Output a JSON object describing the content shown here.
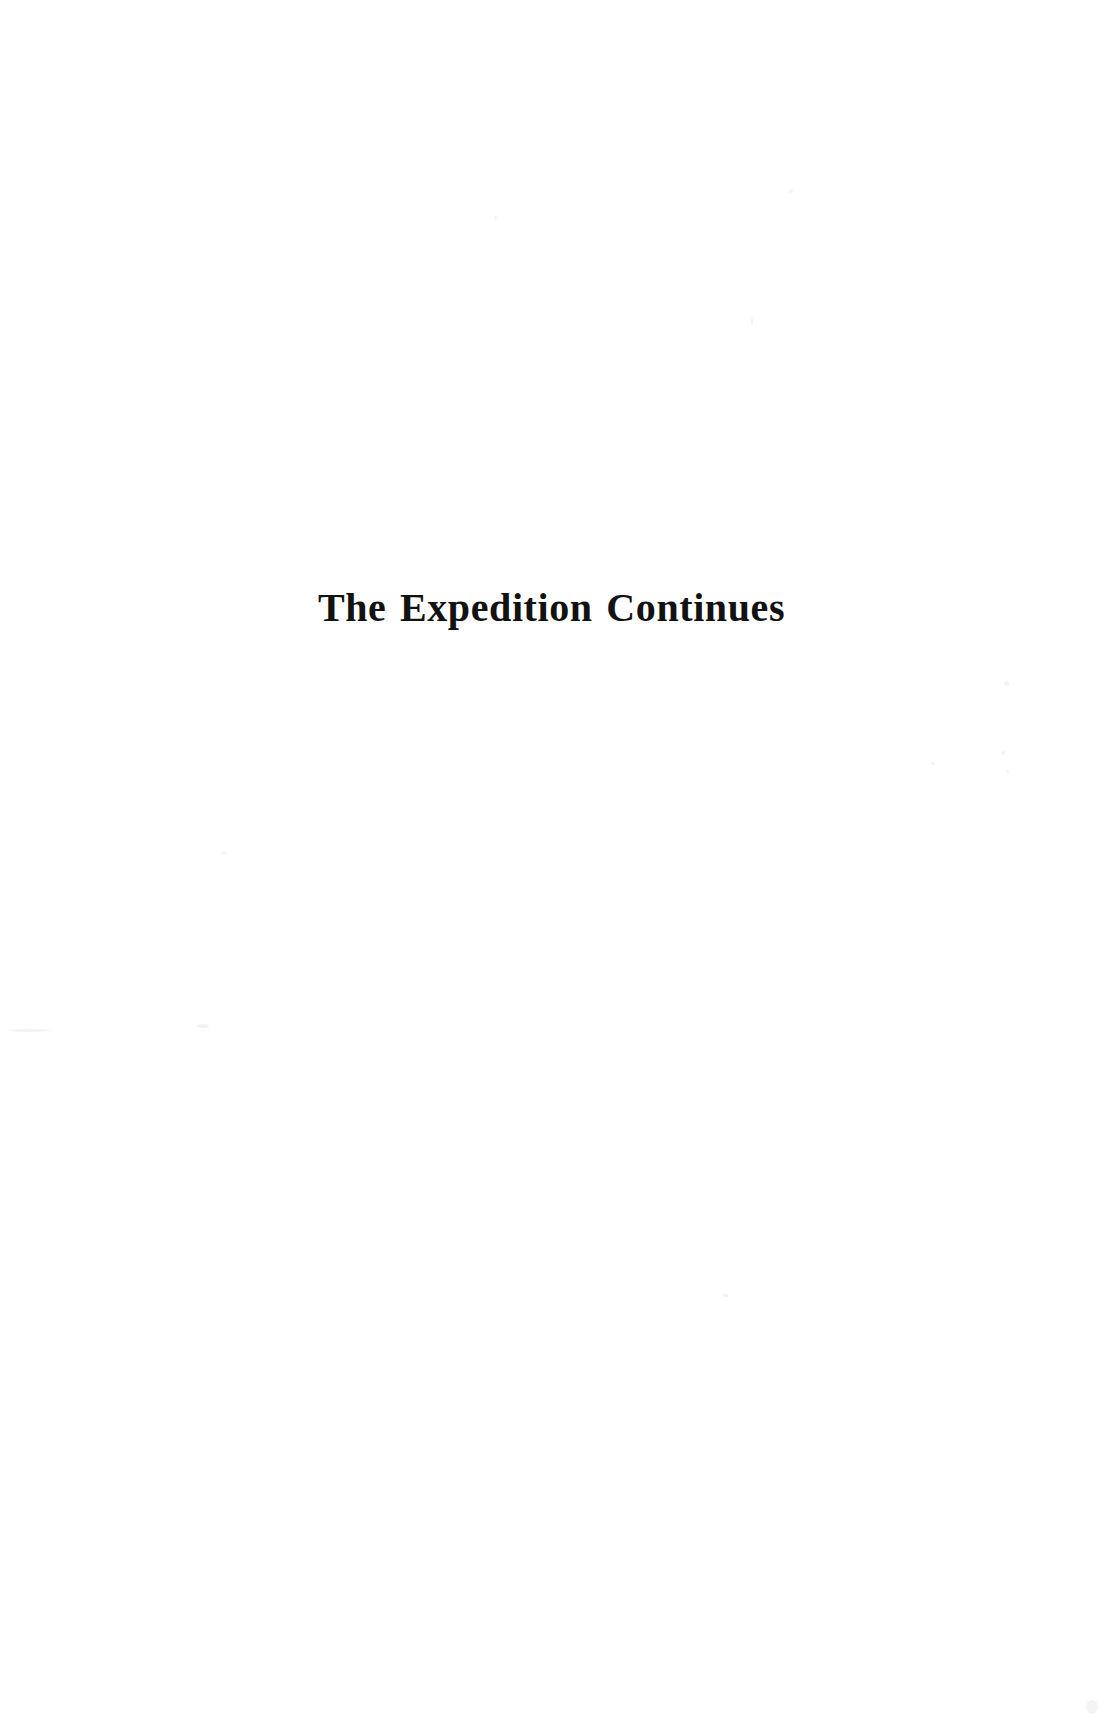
{
  "document": {
    "page_kind": "chapter-title-page",
    "background_color": "#ffffff",
    "text_color": "#121212",
    "body_text": ""
  },
  "title": {
    "text": "The Expedition Continues",
    "alignment": "center",
    "style": "bold-serif"
  },
  "page_number": "",
  "header": {
    "running_head": ""
  },
  "footer": {
    "running_foot": ""
  }
}
